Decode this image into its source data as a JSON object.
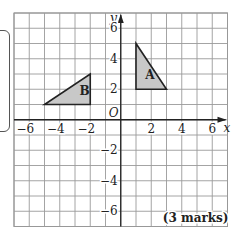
{
  "diagram": {
    "type": "coordinate-grid",
    "grid": {
      "x_min": -7,
      "x_max": 7,
      "y_min": -7,
      "y_max": 7,
      "step": 1
    },
    "axes": {
      "x_label": "x",
      "y_label": "y",
      "origin_label": "O",
      "x_ticks": [
        {
          "value": -6,
          "label": "−6"
        },
        {
          "value": -4,
          "label": "−4"
        },
        {
          "value": -2,
          "label": "−2"
        },
        {
          "value": 2,
          "label": "2"
        },
        {
          "value": 4,
          "label": "4"
        },
        {
          "value": 6,
          "label": "6"
        }
      ],
      "y_ticks": [
        {
          "value": 6,
          "label": "6"
        },
        {
          "value": 4,
          "label": "4"
        },
        {
          "value": 2,
          "label": "2"
        },
        {
          "value": -2,
          "label": "−2"
        },
        {
          "value": -4,
          "label": "−4"
        },
        {
          "value": -6,
          "label": "−6"
        }
      ]
    },
    "shapes": [
      {
        "name": "A",
        "label": "A",
        "vertices": [
          [
            1,
            5
          ],
          [
            1,
            2
          ],
          [
            3,
            2
          ]
        ],
        "label_at": [
          1.6,
          2.7
        ],
        "fill": "#c8c8c8"
      },
      {
        "name": "B",
        "label": "B",
        "vertices": [
          [
            -5,
            1
          ],
          [
            -2,
            1
          ],
          [
            -2,
            3
          ]
        ],
        "label_at": [
          -2.7,
          1.6
        ],
        "fill": "#c8c8c8"
      }
    ],
    "marks_label": "(3 marks)"
  }
}
